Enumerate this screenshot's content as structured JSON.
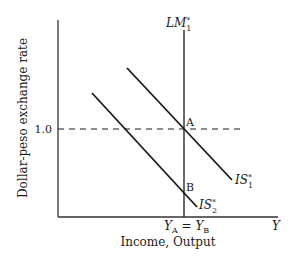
{
  "diagram": {
    "y_axis_label": "Dollar-peso exchange rate",
    "x_axis_label": "Income, Output",
    "x_axis_end_label": "Y",
    "y_tick_label": "1.0",
    "x_tick_label_main": "Y",
    "x_tick_sub_a": "A",
    "x_tick_eq": " = Y",
    "x_tick_sub_b": "B",
    "curves": {
      "lm1": {
        "name": "LM",
        "sup": "*",
        "sub": "1"
      },
      "is1": {
        "name": "IS",
        "sup": "*",
        "sub": "1"
      },
      "is2": {
        "name": "IS",
        "sup": "*",
        "sub": "2"
      }
    },
    "points": {
      "a": "A",
      "b": "B"
    },
    "colors": {
      "line": "#1a1a1a",
      "axis": "#333333"
    }
  }
}
